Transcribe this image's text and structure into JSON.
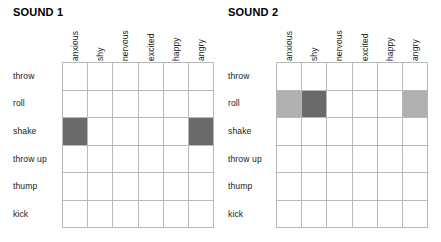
{
  "chart_data": {
    "type": "heatmap",
    "title": "",
    "xlabel": "",
    "ylabel": "",
    "grid": true,
    "legend": "none",
    "categories": [
      "anxious",
      "shy",
      "nervous",
      "excited",
      "happy",
      "angry"
    ],
    "rows": [
      "throw",
      "roll",
      "shake",
      "throw up",
      "thump",
      "kick"
    ],
    "levels": {
      "none": 0,
      "light": 1,
      "dark": 2
    },
    "colors": {
      "none": "#ffffff",
      "light": "#b0b0b0",
      "dark": "#6a6a6a",
      "gridline": "#b9b9b9"
    },
    "panels": [
      {
        "title": "SOUND 1",
        "values": [
          [
            0,
            0,
            0,
            0,
            0,
            0
          ],
          [
            0,
            0,
            0,
            0,
            0,
            0
          ],
          [
            2,
            0,
            0,
            0,
            0,
            2
          ],
          [
            0,
            0,
            0,
            0,
            0,
            0
          ],
          [
            0,
            0,
            0,
            0,
            0,
            0
          ],
          [
            0,
            0,
            0,
            0,
            0,
            0
          ]
        ]
      },
      {
        "title": "SOUND 2",
        "values": [
          [
            0,
            0,
            0,
            0,
            0,
            0
          ],
          [
            1,
            2,
            0,
            0,
            0,
            1
          ],
          [
            0,
            0,
            0,
            0,
            0,
            0
          ],
          [
            0,
            0,
            0,
            0,
            0,
            0
          ],
          [
            0,
            0,
            0,
            0,
            0,
            0
          ],
          [
            0,
            0,
            0,
            0,
            0,
            0
          ]
        ]
      }
    ]
  },
  "panels": [
    {
      "title": "SOUND 1",
      "columns": [
        "anxious",
        "shy",
        "nervous",
        "excited",
        "happy",
        "angry"
      ],
      "rows": [
        "throw",
        "roll",
        "shake",
        "throw up",
        "thump",
        "kick"
      ]
    },
    {
      "title": "SOUND 2",
      "columns": [
        "anxious",
        "shy",
        "nervous",
        "excited",
        "happy",
        "angry"
      ],
      "rows": [
        "throw",
        "roll",
        "shake",
        "throw up",
        "thump",
        "kick"
      ]
    }
  ]
}
